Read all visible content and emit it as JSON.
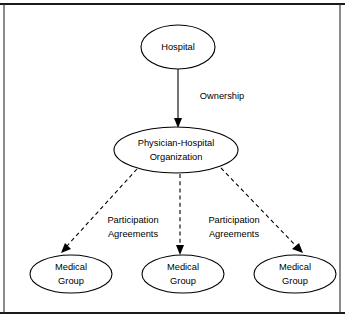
{
  "figure": {
    "background_color": "#ffffff",
    "line_color": "#000000",
    "frame_color": "#1a1a1a"
  },
  "nodes": {
    "hospital": {
      "label": "Hospital",
      "shape": "ellipse",
      "cx": 178,
      "cy": 47,
      "rx": 37,
      "ry": 22
    },
    "pho": {
      "label_line1": "Physician-Hospital",
      "label_line2": "Organization",
      "shape": "ellipse",
      "cx": 176,
      "cy": 150,
      "rx": 62,
      "ry": 23
    },
    "medical_group_left": {
      "label_line1": "Medical",
      "label_line2": "Group",
      "shape": "ellipse",
      "cx": 71,
      "cy": 274,
      "rx": 41,
      "ry": 19
    },
    "medical_group_center": {
      "label_line1": "Medical",
      "label_line2": "Group",
      "shape": "ellipse",
      "cx": 183,
      "cy": 274,
      "rx": 41,
      "ry": 19
    },
    "medical_group_right": {
      "label_line1": "Medical",
      "label_line2": "Group",
      "shape": "ellipse",
      "cx": 295,
      "cy": 274,
      "rx": 41,
      "ry": 19
    }
  },
  "edges": {
    "ownership": {
      "label": "Ownership",
      "style": "solid",
      "arrow": true,
      "from": "hospital",
      "to": "pho",
      "label_x": 222,
      "label_y": 97
    },
    "participation_left": {
      "label_line1": "Participation",
      "label_line2": "Agreements",
      "style": "dashed",
      "arrow": true,
      "from": "pho",
      "to": "medical_group_left",
      "label_x": 133,
      "label_y": 228
    },
    "participation_right": {
      "label_line1": "Participation",
      "label_line2": "Agreements",
      "style": "dashed",
      "arrow": true,
      "from": "pho",
      "to": "medical_group_right",
      "label_x": 234,
      "label_y": 228
    },
    "participation_center": {
      "style": "dashed",
      "arrow": true,
      "from": "pho",
      "to": "medical_group_center"
    }
  }
}
